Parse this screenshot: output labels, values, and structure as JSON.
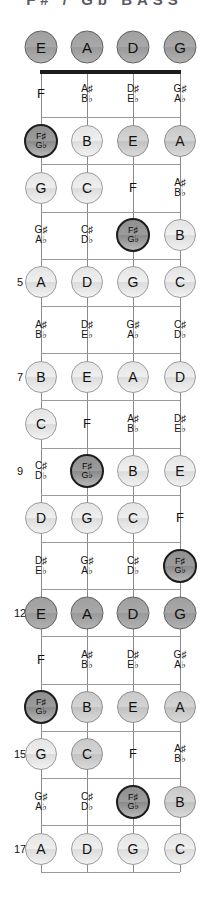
{
  "title": {
    "text": "F# / Gb BASS"
  },
  "instrument": {
    "type": "bass-fretboard-diagram",
    "strings": [
      "E",
      "A",
      "D",
      "G"
    ],
    "highlight_note": "F#/Gb",
    "fret_range": [
      1,
      17
    ],
    "marked_frets": [
      5,
      7,
      9,
      12,
      15,
      17
    ]
  },
  "open_strings": [
    {
      "label": "E",
      "style": "dark"
    },
    {
      "label": "A",
      "style": "dark"
    },
    {
      "label": "D",
      "style": "dark"
    },
    {
      "label": "G",
      "style": "dark"
    }
  ],
  "frets": [
    {
      "number": 1,
      "show_number": false,
      "notes": [
        {
          "label": "F",
          "style": "plain"
        },
        {
          "l1": "A♯",
          "l2": "B♭",
          "style": "plain-acc"
        },
        {
          "l1": "D♯",
          "l2": "E♭",
          "style": "plain-acc"
        },
        {
          "l1": "G♯",
          "l2": "A♭",
          "style": "plain-acc"
        }
      ]
    },
    {
      "number": 2,
      "show_number": false,
      "notes": [
        {
          "l1": "F♯",
          "l2": "G♭",
          "style": "accent"
        },
        {
          "label": "B",
          "style": "light"
        },
        {
          "label": "E",
          "style": "mid"
        },
        {
          "label": "A",
          "style": "mid"
        }
      ]
    },
    {
      "number": 3,
      "show_number": false,
      "notes": [
        {
          "label": "G",
          "style": "light"
        },
        {
          "label": "C",
          "style": "light"
        },
        {
          "label": "F",
          "style": "plain"
        },
        {
          "l1": "A♯",
          "l2": "B♭",
          "style": "plain-acc"
        }
      ]
    },
    {
      "number": 4,
      "show_number": false,
      "notes": [
        {
          "l1": "G♯",
          "l2": "A♭",
          "style": "plain-acc"
        },
        {
          "l1": "C♯",
          "l2": "D♭",
          "style": "plain-acc"
        },
        {
          "l1": "F♯",
          "l2": "G♭",
          "style": "accent"
        },
        {
          "label": "B",
          "style": "light"
        }
      ]
    },
    {
      "number": 5,
      "show_number": true,
      "notes": [
        {
          "label": "A",
          "style": "light"
        },
        {
          "label": "D",
          "style": "light"
        },
        {
          "label": "G",
          "style": "light"
        },
        {
          "label": "C",
          "style": "light"
        }
      ]
    },
    {
      "number": 6,
      "show_number": false,
      "notes": [
        {
          "l1": "A♯",
          "l2": "B♭",
          "style": "plain-acc"
        },
        {
          "l1": "D♯",
          "l2": "E♭",
          "style": "plain-acc"
        },
        {
          "l1": "G♯",
          "l2": "A♭",
          "style": "plain-acc"
        },
        {
          "l1": "C♯",
          "l2": "D♭",
          "style": "plain-acc"
        }
      ]
    },
    {
      "number": 7,
      "show_number": true,
      "notes": [
        {
          "label": "B",
          "style": "light"
        },
        {
          "label": "E",
          "style": "light"
        },
        {
          "label": "A",
          "style": "light"
        },
        {
          "label": "D",
          "style": "light"
        }
      ]
    },
    {
      "number": 8,
      "show_number": false,
      "notes": [
        {
          "label": "C",
          "style": "light"
        },
        {
          "label": "F",
          "style": "plain"
        },
        {
          "l1": "A♯",
          "l2": "B♭",
          "style": "plain-acc"
        },
        {
          "l1": "D♯",
          "l2": "E♭",
          "style": "plain-acc"
        }
      ]
    },
    {
      "number": 9,
      "show_number": true,
      "notes": [
        {
          "l1": "C♯",
          "l2": "D♭",
          "style": "plain-acc"
        },
        {
          "l1": "F♯",
          "l2": "G♭",
          "style": "accent"
        },
        {
          "label": "B",
          "style": "light"
        },
        {
          "label": "E",
          "style": "light"
        }
      ]
    },
    {
      "number": 10,
      "show_number": false,
      "notes": [
        {
          "label": "D",
          "style": "light"
        },
        {
          "label": "G",
          "style": "light"
        },
        {
          "label": "C",
          "style": "light"
        },
        {
          "label": "F",
          "style": "plain"
        }
      ]
    },
    {
      "number": 11,
      "show_number": false,
      "notes": [
        {
          "l1": "D♯",
          "l2": "E♭",
          "style": "plain-acc"
        },
        {
          "l1": "G♯",
          "l2": "A♭",
          "style": "plain-acc"
        },
        {
          "l1": "C♯",
          "l2": "D♭",
          "style": "plain-acc"
        },
        {
          "l1": "F♯",
          "l2": "G♭",
          "style": "accent"
        }
      ]
    },
    {
      "number": 12,
      "show_number": true,
      "notes": [
        {
          "label": "E",
          "style": "dark"
        },
        {
          "label": "A",
          "style": "dark"
        },
        {
          "label": "D",
          "style": "dark"
        },
        {
          "label": "G",
          "style": "dark"
        }
      ]
    },
    {
      "number": 13,
      "show_number": false,
      "notes": [
        {
          "label": "F",
          "style": "plain"
        },
        {
          "l1": "A♯",
          "l2": "B♭",
          "style": "plain-acc"
        },
        {
          "l1": "D♯",
          "l2": "E♭",
          "style": "plain-acc"
        },
        {
          "l1": "G♯",
          "l2": "A♭",
          "style": "plain-acc"
        }
      ]
    },
    {
      "number": 14,
      "show_number": false,
      "notes": [
        {
          "l1": "F♯",
          "l2": "G♭",
          "style": "accent"
        },
        {
          "label": "B",
          "style": "mid"
        },
        {
          "label": "E",
          "style": "mid"
        },
        {
          "label": "A",
          "style": "mid"
        }
      ]
    },
    {
      "number": 15,
      "show_number": true,
      "notes": [
        {
          "label": "G",
          "style": "light"
        },
        {
          "label": "C",
          "style": "mid"
        },
        {
          "label": "F",
          "style": "plain"
        },
        {
          "l1": "A♯",
          "l2": "B♭",
          "style": "plain-acc"
        }
      ]
    },
    {
      "number": 16,
      "show_number": false,
      "notes": [
        {
          "l1": "G♯",
          "l2": "A♭",
          "style": "plain-acc"
        },
        {
          "l1": "C♯",
          "l2": "D♭",
          "style": "plain-acc"
        },
        {
          "l1": "F♯",
          "l2": "G♭",
          "style": "accent"
        },
        {
          "label": "B",
          "style": "mid"
        }
      ]
    },
    {
      "number": 17,
      "show_number": true,
      "notes": [
        {
          "label": "A",
          "style": "light"
        },
        {
          "label": "D",
          "style": "light"
        },
        {
          "label": "G",
          "style": "light"
        },
        {
          "label": "C",
          "style": "light"
        }
      ]
    }
  ],
  "colors": {
    "accent_ring": "#1c1c1c",
    "circle_light": "#e8e8e8",
    "circle_mid": "#cccccc",
    "circle_dark": "#a5a5a5",
    "fretline": "#9a9a9a",
    "nut": "#1d1d1d"
  }
}
